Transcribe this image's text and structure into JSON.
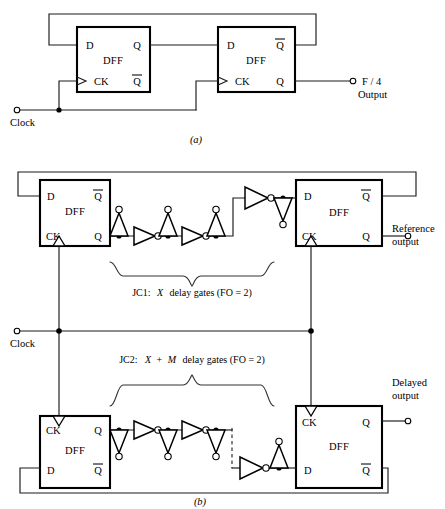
{
  "figure": {
    "panels": [
      {
        "id": "a",
        "caption": "(a)",
        "description": "Divide-by-four: two cascaded D flip-flops with Q-bar feedback"
      },
      {
        "id": "b",
        "caption": "(b)",
        "description": "Two Johnson-counter delay chains JC1 and JC2 driving reference and delayed outputs"
      }
    ]
  },
  "panel_a": {
    "caption": "(a)",
    "dff1": {
      "body": "DFF",
      "pin_d": "D",
      "pin_q": "Q",
      "pin_ck": "CK",
      "pin_qbar": "Q"
    },
    "dff2": {
      "body": "DFF",
      "pin_d": "D",
      "pin_qbar": "Q",
      "pin_ck": "CK",
      "pin_q": "Q"
    },
    "clock_label": "Clock",
    "output_label_line1": "F / 4",
    "output_label_line2": "Output"
  },
  "panel_b": {
    "caption": "(b)",
    "clock_label": "Clock",
    "dff_top_left": {
      "body": "DFF",
      "pin_d": "D",
      "pin_qbar": "Q",
      "pin_ck": "CK",
      "pin_q": "Q"
    },
    "dff_top_right": {
      "body": "DFF",
      "pin_d": "D",
      "pin_qbar": "Q",
      "pin_ck": "CK",
      "pin_q": "Q"
    },
    "dff_bottom_left": {
      "body": "DFF",
      "pin_ck": "CK",
      "pin_q": "Q",
      "pin_d": "D",
      "pin_qbar": "Q"
    },
    "dff_bottom_right": {
      "body": "DFF",
      "pin_ck": "CK",
      "pin_q": "Q",
      "pin_d": "D",
      "pin_qbar": "Q"
    },
    "jc1": {
      "prefix": "JC1:",
      "var": "X",
      "suffix": "delay gates (FO = 2)"
    },
    "jc2": {
      "prefix": "JC2:",
      "var1": "X",
      "plus": "+",
      "var2": "M",
      "suffix": "delay gates (FO = 2)"
    },
    "reference_output_line1": "Reference",
    "reference_output_line2": "output",
    "delayed_output_line1": "Delayed",
    "delayed_output_line2": "output"
  },
  "colors": {
    "ink": "#000000",
    "wire": "#1a1a1a",
    "paper": "#ffffff",
    "brace": "#333333"
  }
}
